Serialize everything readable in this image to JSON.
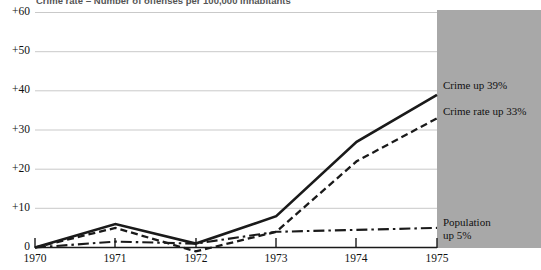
{
  "chart_data": {
    "type": "line",
    "title": "Crime rate = Number of offenses per 100,000 inhabitants",
    "xlabel": "",
    "ylabel": "",
    "x": [
      1970,
      1971,
      1972,
      1973,
      1974,
      1975
    ],
    "categories": [
      "1970",
      "1971",
      "1972",
      "1973",
      "1974",
      "1975"
    ],
    "xtick_labels": [
      "1970",
      "1971",
      "1972",
      "1973",
      "1974",
      "1975"
    ],
    "ytick_labels": [
      "0",
      "+10",
      "+20",
      "+30",
      "+40",
      "+50",
      "+60"
    ],
    "ytick_values": [
      0,
      10,
      20,
      30,
      40,
      50,
      60
    ],
    "ylim": [
      0,
      60
    ],
    "xlim": [
      1970,
      1975
    ],
    "grid": true,
    "grid_orientation": "horizontal",
    "legend_position": "right-inline",
    "series": [
      {
        "name": "Crime",
        "style": "solid",
        "color": "#1a1a1a",
        "values": [
          0,
          6,
          1,
          8,
          27,
          39
        ],
        "end_label": "Crime up 39%"
      },
      {
        "name": "Crime rate",
        "style": "dashed",
        "color": "#1a1a1a",
        "values": [
          0,
          5,
          -1,
          4,
          22,
          33
        ],
        "end_label": "Crime rate up 33%"
      },
      {
        "name": "Population",
        "style": "dash-dot",
        "color": "#1a1a1a",
        "values": [
          0,
          1.5,
          1,
          4,
          4.5,
          5
        ],
        "end_label": "Population up 5%"
      }
    ],
    "annotations": [
      {
        "text": "Crime up 39%",
        "series": "Crime"
      },
      {
        "text": "Crime rate up 33%",
        "series": "Crime rate"
      },
      {
        "text": "Population",
        "series": "Population"
      },
      {
        "text": "up 5%",
        "series": "Population"
      }
    ]
  },
  "axis": {
    "y": {
      "t60": "+60",
      "t50": "+50",
      "t40": "+40",
      "t30": "+30",
      "t20": "+20",
      "t10": "+10",
      "t0": "0"
    },
    "x": {
      "t1970": "1970",
      "t1971": "1971",
      "t1972": "1972",
      "t1973": "1973",
      "t1974": "1974",
      "t1975": "1975"
    }
  },
  "annotations": {
    "crime": "Crime up 39%",
    "crime_rate": "Crime rate up 33%",
    "population_line1": "Population",
    "population_line2": "up 5%"
  },
  "colors": {
    "panel": "#a8a8a8",
    "line": "#1a1a1a",
    "grid": "#c9c9c9",
    "background": "#ffffff"
  }
}
